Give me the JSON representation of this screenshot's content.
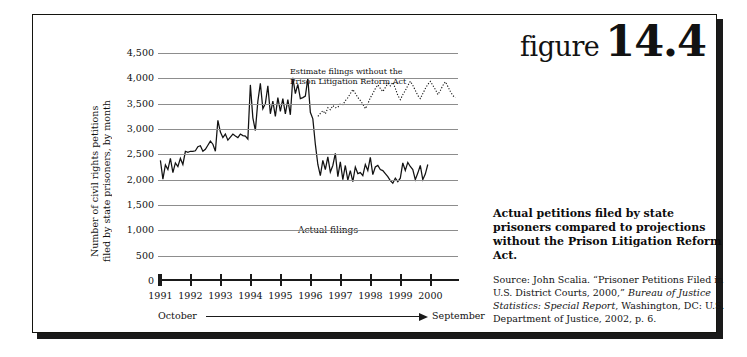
{
  "figure": {
    "word": "figure",
    "number": "14.4"
  },
  "caption": {
    "title": "Actual petitions filed by state prisoners compared to projections without the Prison Litigation Reform Act.",
    "source_prefix": "Source: John Scalia. “Prisoner Petitions Filed in U.S. District Courts, 2000,” ",
    "source_italic": "Bureau of Justice Statistics: Special Report",
    "source_suffix": ", Washington, DC: U.S. Department of Justice, 2002, p. 6."
  },
  "axis": {
    "y_title": "Number of civil rights petitions\nfiled by state prisoners, by month",
    "x_range_start": "October",
    "x_range_end": "September",
    "arrow_icon": "right-arrow-icon"
  },
  "chart_data": {
    "type": "line",
    "title": "",
    "xlabel": "",
    "ylabel": "Number of civil rights petitions filed by state prisoners, by month",
    "ylim": [
      0,
      4500
    ],
    "ytick_values": [
      0,
      500,
      1000,
      1500,
      2000,
      2500,
      3000,
      3500,
      4000,
      4500
    ],
    "ytick_labels": [
      "0",
      "500",
      "1,000",
      "1,500",
      "2,000",
      "2,500",
      "3,000",
      "3,500",
      "4,000",
      "4,500"
    ],
    "xtick_labels": [
      "1991",
      "1992",
      "1993",
      "1994",
      "1995",
      "1996",
      "1997",
      "1998",
      "1999",
      "2000"
    ],
    "grid": true,
    "legend": "none",
    "annotations": [
      {
        "name": "estimate-label",
        "text": "Estimate filings without the\nPrison Litigation Reform Act"
      },
      {
        "name": "actual-label",
        "text": "Actual filings"
      }
    ],
    "series": [
      {
        "name": "Actual filings",
        "style": "solid",
        "x_start": 1991.0,
        "x_step": 0.0833,
        "values": [
          2380,
          2010,
          2290,
          2200,
          2420,
          2140,
          2330,
          2260,
          2420,
          2300,
          2560,
          2540,
          2560,
          2560,
          2570,
          2650,
          2670,
          2560,
          2600,
          2680,
          2760,
          2700,
          2560,
          3170,
          2940,
          2830,
          2900,
          2780,
          2840,
          2900,
          2860,
          2830,
          2900,
          2870,
          2860,
          2800,
          3870,
          3220,
          2970,
          3550,
          3900,
          3400,
          3500,
          3850,
          3300,
          3550,
          3250,
          3620,
          3350,
          3600,
          3300,
          3580,
          3280,
          4010,
          3700,
          3880,
          3600,
          3620,
          3650,
          4000,
          3330,
          3200,
          2700,
          2300,
          2080,
          2380,
          2200,
          2450,
          2150,
          2280,
          2520,
          2060,
          2350,
          2000,
          2280,
          1990,
          2180,
          1960,
          2250,
          2120,
          2140,
          2080,
          2300,
          2180,
          2440,
          2100,
          2250,
          2280,
          2200,
          2180,
          2120,
          2060,
          1980,
          1930,
          2030,
          1960,
          2030,
          2330,
          2180,
          2340,
          2260,
          2200,
          2000,
          2130,
          2280,
          2000,
          2110,
          2300
        ]
      },
      {
        "name": "Estimate filings without the Prison Litigation Reform Act",
        "style": "dotted",
        "x_start": 1996.25,
        "x_step": 0.0833,
        "values": [
          3250,
          3310,
          3360,
          3300,
          3420,
          3380,
          3460,
          3420,
          3430,
          3500,
          3480,
          3560,
          3620,
          3700,
          3780,
          3700,
          3620,
          3560,
          3490,
          3400,
          3500,
          3620,
          3700,
          3800,
          3870,
          3800,
          3740,
          3820,
          3900,
          3850,
          3920,
          3800,
          3660,
          3580,
          3680,
          3760,
          3860,
          3940,
          3860,
          3760,
          3660,
          3600,
          3700,
          3800,
          3880,
          3940,
          3860,
          3780,
          3680,
          3760,
          3860,
          3930,
          3840,
          3740,
          3660,
          3620
        ]
      }
    ]
  }
}
